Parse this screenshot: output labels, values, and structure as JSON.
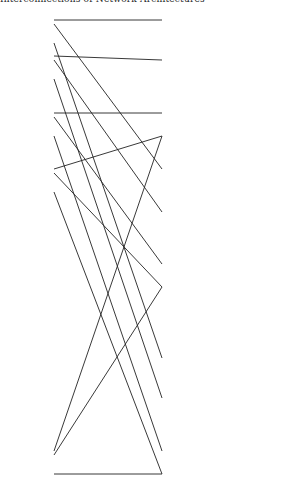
{
  "header": {
    "text": "Interconnections of Network Architectures"
  },
  "diagram": {
    "type": "three-stage switching network",
    "stages": [
      {
        "name": "input-stage",
        "x": 30,
        "switch_y": [
          17,
          53,
          110,
          166,
          448
        ],
        "ellipsis_after_index": [
          1,
          3
        ]
      },
      {
        "name": "middle-stage",
        "x": 170,
        "groups": [
          {
            "switch_y": [
              17,
              53,
              110
            ]
          },
          {
            "switch_y": [
              166,
              205,
              261
            ]
          },
          {
            "switch_y": [
              355,
              391,
              448
            ]
          }
        ]
      },
      {
        "name": "output-stage",
        "x": 267,
        "groups": [
          {
            "switch_y": [
              17,
              53,
              110
            ]
          },
          {
            "switch_y": [
              166,
              205,
              261
            ]
          },
          {
            "switch_y": [
              355,
              391,
              448
            ]
          }
        ]
      }
    ],
    "line_color": "#222222",
    "box_fill": "#ffffff"
  }
}
